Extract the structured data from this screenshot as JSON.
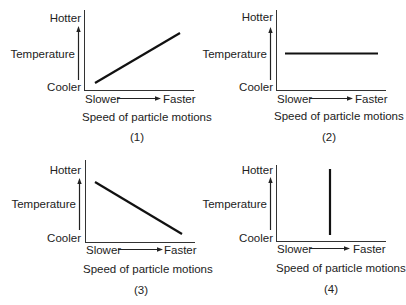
{
  "figure": {
    "panels": [
      {
        "id": "1",
        "caption": "(1)",
        "y_top": "Hotter",
        "y_mid": "Temperature",
        "y_bottom": "Cooler",
        "x_left": "Slower",
        "x_right": "Faster",
        "x_title": "Speed of particle motions",
        "trend": "increasing"
      },
      {
        "id": "2",
        "caption": "(2)",
        "y_top": "Hotter",
        "y_mid": "Temperature",
        "y_bottom": "Cooler",
        "x_left": "Slower",
        "x_right": "Faster",
        "x_title": "Speed of particle motions",
        "trend": "constant"
      },
      {
        "id": "3",
        "caption": "(3)",
        "y_top": "Hotter",
        "y_mid": "Temperature",
        "y_bottom": "Cooler",
        "x_left": "Slower",
        "x_right": "Faster",
        "x_title": "Speed of particle motions",
        "trend": "decreasing"
      },
      {
        "id": "4",
        "caption": "(4)",
        "y_top": "Hotter",
        "y_mid": "Temperature",
        "y_bottom": "Cooler",
        "x_left": "Slower",
        "x_right": "Faster",
        "x_title": "Speed of particle motions",
        "trend": "vertical"
      }
    ],
    "line_color": "#111111"
  }
}
